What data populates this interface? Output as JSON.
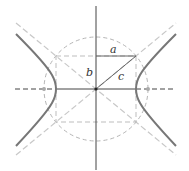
{
  "diagram": {
    "type": "hyperbola-geometry",
    "center": [
      96,
      89
    ],
    "a": 40,
    "b": 33,
    "c": 52,
    "labels": {
      "a": "a",
      "b": "b",
      "c": "c"
    },
    "colors": {
      "axis": "#444444",
      "hyperbola": "#777777",
      "asymptote": "#c8c8c8",
      "rectangle": "#bdbdbd",
      "circle": "#b5b5b5",
      "triangle": "#666666",
      "focus": "#aaaaaa",
      "label": "#333333"
    }
  }
}
